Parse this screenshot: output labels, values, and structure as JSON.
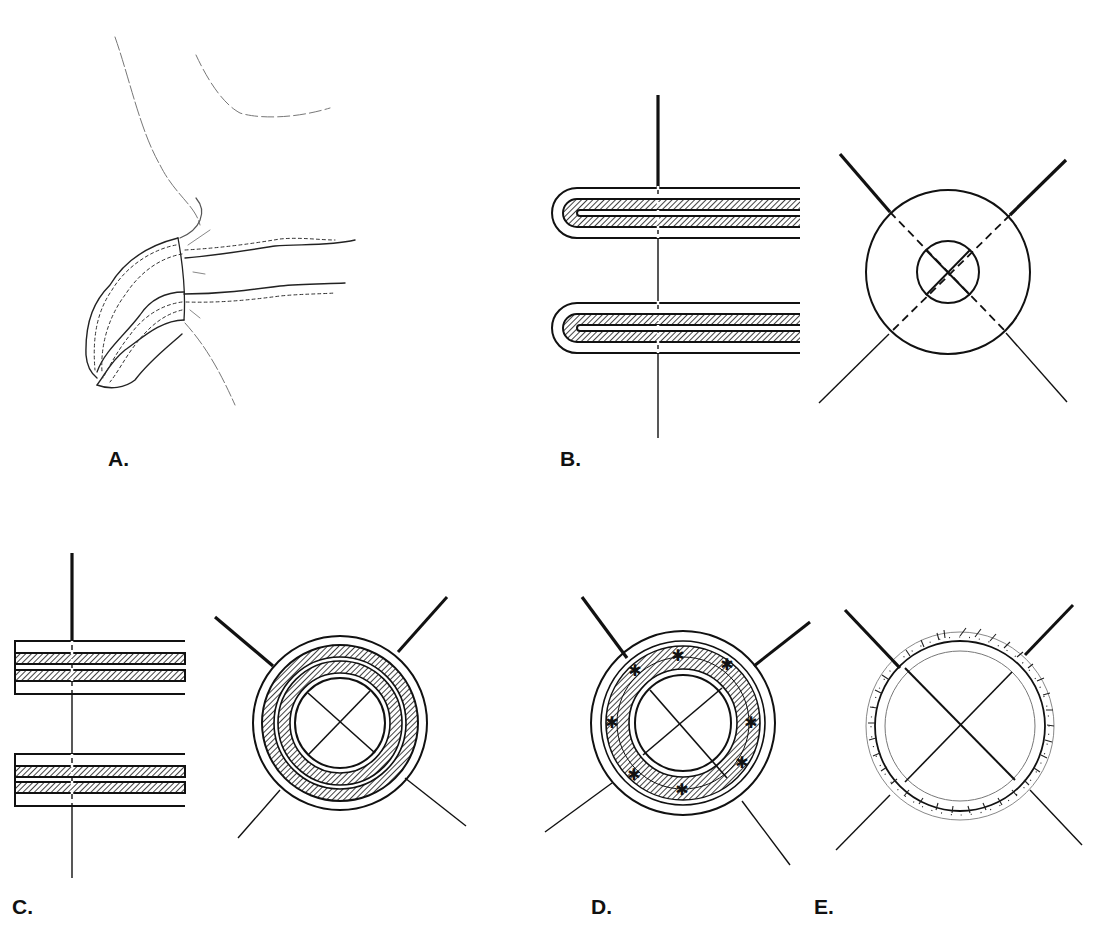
{
  "figure": {
    "panels": [
      {
        "id": "A",
        "label": "A.",
        "description": "Freehand sketch of a tubular structure folded at an angle with dotted inner contour lines"
      },
      {
        "id": "B",
        "label": "B.",
        "description": "Two U-shaped hatched tubes pierced by a vertical line; cross-section with two concentric circles crossed by diagonal lines (dashed inside outer circle)"
      },
      {
        "id": "C",
        "label": "C.",
        "description": "Two stacked double-hatched layers pierced by a vertical line; cross-section with concentric hatched rings"
      },
      {
        "id": "D",
        "label": "D.",
        "description": "Cross-section with hatched ring containing star-shaped suture marks"
      },
      {
        "id": "E",
        "label": "E.",
        "description": "Cross-section with a thin ring bordered by oblique hash marks"
      }
    ],
    "colors": {
      "ink": "#111111",
      "paper": "#ffffff",
      "sketch": "#555555"
    },
    "caption_clipped": true
  }
}
